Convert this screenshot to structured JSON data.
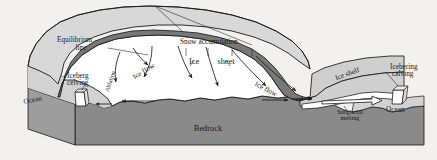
{
  "figure": {
    "type": "cross-section-diagram",
    "background_color": "#f2f1ee"
  },
  "colors": {
    "bedrock": "#8a8a8a",
    "bedrock_side": "#9d9d9d",
    "ocean": "#d2d2d2",
    "ocean_side": "#c4c4c4",
    "ice": "#ffffff",
    "ice_top_surface": "#d8d8d8",
    "snow_band": "#787878",
    "ice_shelf": "#cfcfcf",
    "outline": "#1a1a1a",
    "label_text": "#1a1a1a"
  },
  "labels": {
    "equilibrium_line_1": "Equilibrium",
    "equilibrium_line_2": "line",
    "snow_accumulation": "Snow accumulation",
    "ice_sheet_word1": "Ice",
    "ice_sheet_word2": "sheet",
    "ice_flow_left": "Ice flow",
    "ice_flow_right": "Ice flow",
    "ablation": "Ablation",
    "ice_shelf": "Ice shelf",
    "iceberg_calving_left_1": "Iceberg",
    "iceberg_calving_left_2": "celving",
    "iceberg_calving_right_1": "Icebering",
    "iceberg_calving_right_2": "calving",
    "ocean_left": "Ocean",
    "ocean_right": "Ocean",
    "bedrock": "Bedrock",
    "subglacial_melting_1": "Subglacial",
    "subglacial_melting_2": "melting"
  },
  "icons": {
    "arrow_head": "arrow-head-icon",
    "leader_line": "leader-line-icon",
    "calving_block": "iceberg-block-icon"
  }
}
